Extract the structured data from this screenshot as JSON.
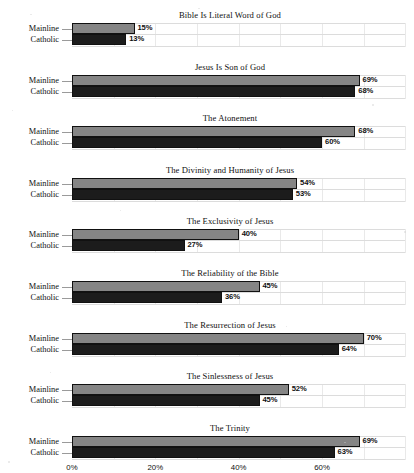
{
  "chart_data": {
    "type": "bar",
    "orientation": "horizontal",
    "title": "",
    "xlabel": "",
    "ylabel": "",
    "xlim": [
      0,
      80
    ],
    "xticks": [
      "0%",
      "20%",
      "40%",
      "60%"
    ],
    "xtick_values": [
      0,
      20,
      40,
      60
    ],
    "grid": true,
    "legend_position": "none",
    "value_suffix": "%",
    "categories": [
      "Mainline",
      "Catholic"
    ],
    "series": [
      {
        "name": "Mainline",
        "color": "#858585"
      },
      {
        "name": "Catholic",
        "color": "#1c1c1c"
      }
    ],
    "panels": [
      {
        "title": "Bible Is Literal Word of God",
        "values": [
          15,
          13
        ],
        "labels": [
          "15%",
          "13%"
        ]
      },
      {
        "title": "Jesus Is Son of God",
        "values": [
          69,
          68
        ],
        "labels": [
          "69%",
          "68%"
        ]
      },
      {
        "title": "The Atonement",
        "values": [
          68,
          60
        ],
        "labels": [
          "68%",
          "60%"
        ]
      },
      {
        "title": "The Divinity and Humanity of Jesus",
        "values": [
          54,
          53
        ],
        "labels": [
          "54%",
          "53%"
        ]
      },
      {
        "title": "The Exclusivity of Jesus",
        "values": [
          40,
          27
        ],
        "labels": [
          "40%",
          "27%"
        ]
      },
      {
        "title": "The Reliability of the Bible",
        "values": [
          45,
          36
        ],
        "labels": [
          "45%",
          "36%"
        ]
      },
      {
        "title": "The Resurrection of Jesus",
        "values": [
          70,
          64
        ],
        "labels": [
          "70%",
          "64%"
        ]
      },
      {
        "title": "The Sinlessness of Jesus",
        "values": [
          52,
          45
        ],
        "labels": [
          "52%",
          "45%"
        ]
      },
      {
        "title": "The Trinity",
        "values": [
          69,
          63
        ],
        "labels": [
          "69%",
          "63%"
        ]
      }
    ]
  },
  "axis": {
    "tick_labels": [
      "0%",
      "20%",
      "40%",
      "60%"
    ]
  },
  "row_labels": {
    "mainline": "Mainline",
    "catholic": "Catholic"
  }
}
